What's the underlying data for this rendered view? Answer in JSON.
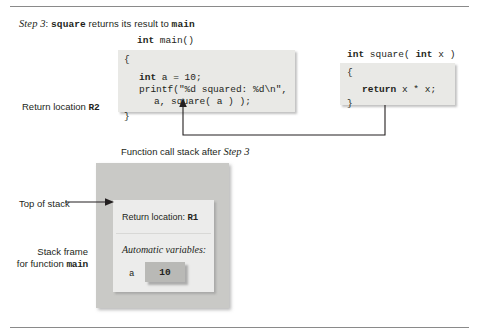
{
  "caption": {
    "step_italic": "Step 3",
    "colon": ": ",
    "func": "square",
    "middle": " returns its result to ",
    "target": "main"
  },
  "main_function": {
    "signature_kw": "int",
    "signature_rest": " main()",
    "open_brace": "{",
    "line1": "int a = 10;",
    "line1_kw": "int",
    "line1_rest": " a = 10;",
    "line2": "printf(\"%d squared: %d\\n\",",
    "line3": "a, square( a ) );",
    "close_brace": "}"
  },
  "square_function": {
    "signature": "int square( int x )",
    "signature_kw1": "int",
    "signature_mid": " square( ",
    "signature_kw2": "int",
    "signature_rest": " x )",
    "open_brace": "{",
    "body_kw": "return",
    "body_rest": " x * x;",
    "close_brace": "}"
  },
  "labels": {
    "return_location_r2_text": "Return location ",
    "return_location_r2_code": "R2",
    "top_of_stack": "Top of stack",
    "stack_frame_line1": "Stack frame",
    "stack_frame_line2_text": "for function ",
    "stack_frame_line2_code": "main"
  },
  "stack": {
    "title_prefix": "Function call stack after ",
    "title_step": "Step 3",
    "return_location_label": "Return location: ",
    "return_location_value": "R1",
    "automatic_variables_label": "Automatic variables:",
    "variable_name": "a",
    "variable_value": "10"
  },
  "colors": {
    "code_box": "#e9e9e6",
    "stack_outer": "#c9c9c6",
    "stack_inner": "#ececeb",
    "var_box": "#b9b9b6",
    "rule": "#8a8a8a",
    "ink": "#231f20"
  }
}
